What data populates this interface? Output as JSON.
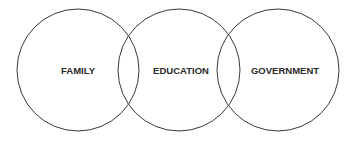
{
  "diagram": {
    "type": "venn",
    "circles": [
      {
        "label": "FAMILY",
        "cx": 78,
        "cy": 70,
        "r": 61
      },
      {
        "label": "EDUCATION",
        "cx": 179,
        "cy": 70,
        "r": 61
      },
      {
        "label": "GOVERNMENT",
        "cx": 278,
        "cy": 70,
        "r": 61
      }
    ],
    "stroke_color": "#3a3a3a"
  }
}
